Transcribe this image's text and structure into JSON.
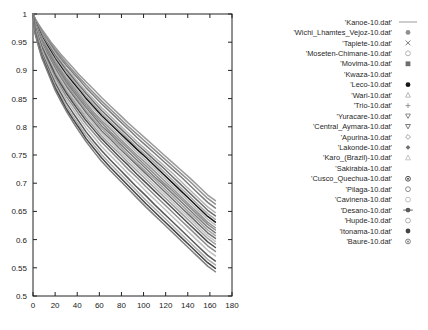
{
  "chart_data": {
    "type": "line",
    "title": "",
    "subtitle": "",
    "xlabel": "",
    "ylabel": "",
    "xlim": [
      0,
      180
    ],
    "ylim": [
      0.5,
      1
    ],
    "grid": false,
    "legend_position": "right",
    "x_ticks": [
      0,
      20,
      40,
      60,
      80,
      100,
      120,
      140,
      160,
      180
    ],
    "y_ticks": [
      0.5,
      0.55,
      0.6,
      0.65,
      0.7,
      0.75,
      0.8,
      0.85,
      0.9,
      0.95,
      1
    ],
    "x_tick_labels": [
      "0",
      "20",
      "40",
      "60",
      "80",
      "100",
      "120",
      "140",
      "160",
      "180"
    ],
    "y_tick_labels": [
      "0.5",
      "0.55",
      "0.6",
      "0.65",
      "0.7",
      "0.75",
      "0.8",
      "0.85",
      "0.9",
      "0.95",
      "1"
    ],
    "x": [
      0,
      2,
      5,
      8,
      12,
      16,
      20,
      25,
      30,
      36,
      42,
      48,
      55,
      62,
      70,
      78,
      86,
      94,
      102,
      110,
      118,
      126,
      134,
      142,
      150,
      158,
      165
    ],
    "series": [
      {
        "name": "'Kanoe-10.dat'",
        "marker": "line",
        "color": "#9a9a9a",
        "values": [
          1,
          0.992,
          0.982,
          0.973,
          0.962,
          0.951,
          0.941,
          0.929,
          0.918,
          0.905,
          0.892,
          0.88,
          0.866,
          0.852,
          0.837,
          0.822,
          0.807,
          0.793,
          0.779,
          0.765,
          0.751,
          0.737,
          0.723,
          0.709,
          0.694,
          0.679,
          0.669
        ]
      },
      {
        "name": "'Wichi_Lhamtes_Vejoz-10.dat'",
        "marker": "dot-small",
        "color": "#8f8f8f",
        "values": [
          1,
          0.991,
          0.98,
          0.97,
          0.959,
          0.948,
          0.937,
          0.925,
          0.913,
          0.9,
          0.887,
          0.874,
          0.86,
          0.846,
          0.831,
          0.816,
          0.801,
          0.787,
          0.773,
          0.759,
          0.745,
          0.731,
          0.717,
          0.703,
          0.688,
          0.673,
          0.663
        ]
      },
      {
        "name": "'Tapiete-10.dat'",
        "marker": "cross-x",
        "color": "#7d7d7d",
        "values": [
          1,
          0.99,
          0.979,
          0.968,
          0.956,
          0.945,
          0.934,
          0.921,
          0.909,
          0.896,
          0.883,
          0.869,
          0.855,
          0.841,
          0.826,
          0.811,
          0.796,
          0.781,
          0.767,
          0.753,
          0.739,
          0.725,
          0.711,
          0.696,
          0.681,
          0.666,
          0.656
        ]
      },
      {
        "name": "'Moseten-Chimane-10.dat'",
        "marker": "circle-open",
        "color": "#b4b4b4",
        "values": [
          1,
          0.989,
          0.977,
          0.966,
          0.954,
          0.942,
          0.93,
          0.917,
          0.904,
          0.891,
          0.877,
          0.863,
          0.849,
          0.834,
          0.819,
          0.804,
          0.789,
          0.774,
          0.76,
          0.746,
          0.732,
          0.718,
          0.703,
          0.688,
          0.673,
          0.658,
          0.648
        ]
      },
      {
        "name": "'Movima-10.dat'",
        "marker": "square-filled",
        "color": "#6e6e6e",
        "values": [
          1,
          0.988,
          0.976,
          0.964,
          0.951,
          0.939,
          0.927,
          0.914,
          0.901,
          0.887,
          0.873,
          0.859,
          0.844,
          0.829,
          0.814,
          0.799,
          0.784,
          0.769,
          0.755,
          0.741,
          0.727,
          0.712,
          0.697,
          0.682,
          0.667,
          0.652,
          0.642
        ]
      },
      {
        "name": "'Kwaza-10.dat'",
        "marker": "none",
        "color": "#a8a8a8",
        "values": [
          1,
          0.987,
          0.974,
          0.962,
          0.949,
          0.936,
          0.924,
          0.91,
          0.897,
          0.883,
          0.869,
          0.854,
          0.839,
          0.824,
          0.809,
          0.794,
          0.779,
          0.764,
          0.75,
          0.736,
          0.721,
          0.706,
          0.691,
          0.676,
          0.661,
          0.646,
          0.636
        ]
      },
      {
        "name": "'Leco-10.dat'",
        "marker": "circle-filled",
        "color": "#161616",
        "values": [
          1,
          0.986,
          0.973,
          0.96,
          0.947,
          0.934,
          0.921,
          0.907,
          0.893,
          0.879,
          0.865,
          0.85,
          0.835,
          0.82,
          0.805,
          0.79,
          0.775,
          0.76,
          0.746,
          0.731,
          0.716,
          0.701,
          0.686,
          0.671,
          0.656,
          0.641,
          0.631
        ]
      },
      {
        "name": "'Wari-10.dat'",
        "marker": "triangle-open",
        "color": "#b9b9b9",
        "values": [
          1,
          0.985,
          0.971,
          0.958,
          0.944,
          0.931,
          0.918,
          0.904,
          0.89,
          0.875,
          0.861,
          0.846,
          0.831,
          0.816,
          0.8,
          0.785,
          0.77,
          0.755,
          0.741,
          0.726,
          0.711,
          0.696,
          0.681,
          0.666,
          0.651,
          0.636,
          0.626
        ]
      },
      {
        "name": "'Trio-10.dat'",
        "marker": "plus",
        "color": "#949494",
        "values": [
          1,
          0.984,
          0.97,
          0.956,
          0.942,
          0.929,
          0.915,
          0.901,
          0.886,
          0.872,
          0.857,
          0.842,
          0.826,
          0.811,
          0.796,
          0.78,
          0.765,
          0.75,
          0.736,
          0.721,
          0.706,
          0.691,
          0.676,
          0.661,
          0.646,
          0.631,
          0.621
        ]
      },
      {
        "name": "'Yuracare-10.dat'",
        "marker": "triangle-down",
        "color": "#8a8a8a",
        "values": [
          1,
          0.983,
          0.968,
          0.954,
          0.94,
          0.926,
          0.912,
          0.898,
          0.883,
          0.868,
          0.853,
          0.838,
          0.822,
          0.807,
          0.791,
          0.776,
          0.761,
          0.746,
          0.731,
          0.716,
          0.701,
          0.687,
          0.672,
          0.657,
          0.642,
          0.627,
          0.617
        ]
      },
      {
        "name": "'Central_Aymara-10.dat'",
        "marker": "triangle-down-small",
        "color": "#7a7a7a",
        "values": [
          1,
          0.982,
          0.967,
          0.952,
          0.938,
          0.923,
          0.909,
          0.894,
          0.879,
          0.864,
          0.849,
          0.834,
          0.818,
          0.802,
          0.787,
          0.771,
          0.756,
          0.741,
          0.726,
          0.711,
          0.697,
          0.682,
          0.667,
          0.652,
          0.637,
          0.622,
          0.612
        ]
      },
      {
        "name": "'Apurina-10.dat'",
        "marker": "diamond-open",
        "color": "#a2a2a2",
        "values": [
          1,
          0.981,
          0.965,
          0.95,
          0.935,
          0.92,
          0.906,
          0.891,
          0.876,
          0.86,
          0.845,
          0.829,
          0.813,
          0.798,
          0.782,
          0.767,
          0.751,
          0.736,
          0.721,
          0.707,
          0.692,
          0.677,
          0.662,
          0.647,
          0.632,
          0.617,
          0.607
        ]
      },
      {
        "name": "'Lakonde-10.dat'",
        "marker": "diamond-filled",
        "color": "#707070",
        "values": [
          1,
          0.98,
          0.964,
          0.948,
          0.933,
          0.918,
          0.903,
          0.887,
          0.872,
          0.856,
          0.841,
          0.825,
          0.809,
          0.793,
          0.778,
          0.762,
          0.747,
          0.732,
          0.717,
          0.702,
          0.687,
          0.672,
          0.657,
          0.642,
          0.627,
          0.612,
          0.602
        ]
      },
      {
        "name": "'Karo_(Brazil)-10.dat'",
        "marker": "triangle-tiny",
        "color": "#c4c4c4",
        "values": [
          1,
          0.979,
          0.962,
          0.946,
          0.93,
          0.915,
          0.9,
          0.884,
          0.868,
          0.852,
          0.836,
          0.821,
          0.805,
          0.789,
          0.773,
          0.757,
          0.742,
          0.727,
          0.712,
          0.697,
          0.682,
          0.667,
          0.652,
          0.637,
          0.622,
          0.607,
          0.597
        ]
      },
      {
        "name": "'Sakirabia-10.dat'",
        "marker": "none",
        "color": "#9e9e9e",
        "values": [
          1,
          0.978,
          0.96,
          0.944,
          0.928,
          0.912,
          0.896,
          0.88,
          0.864,
          0.848,
          0.832,
          0.816,
          0.8,
          0.784,
          0.768,
          0.753,
          0.737,
          0.722,
          0.707,
          0.692,
          0.677,
          0.662,
          0.647,
          0.632,
          0.617,
          0.602,
          0.592
        ]
      },
      {
        "name": "'Cusco_Quechua-10.dat'",
        "marker": "circle-dot",
        "color": "#4f4f4f",
        "values": [
          1,
          0.976,
          0.958,
          0.941,
          0.925,
          0.909,
          0.892,
          0.876,
          0.86,
          0.843,
          0.827,
          0.811,
          0.795,
          0.779,
          0.763,
          0.747,
          0.732,
          0.716,
          0.701,
          0.686,
          0.671,
          0.656,
          0.641,
          0.626,
          0.611,
          0.596,
          0.586
        ]
      },
      {
        "name": "'Pilaga-10.dat'",
        "marker": "circle-dot-open",
        "color": "#8c8c8c",
        "values": [
          1,
          0.974,
          0.956,
          0.938,
          0.921,
          0.904,
          0.888,
          0.871,
          0.854,
          0.838,
          0.821,
          0.805,
          0.789,
          0.773,
          0.757,
          0.741,
          0.725,
          0.71,
          0.694,
          0.679,
          0.664,
          0.649,
          0.634,
          0.619,
          0.604,
          0.589,
          0.579
        ]
      },
      {
        "name": "'Cavinena-10.dat'",
        "marker": "circle-tiny",
        "color": "#bdbdbd",
        "values": [
          1,
          0.972,
          0.953,
          0.935,
          0.917,
          0.9,
          0.883,
          0.866,
          0.849,
          0.832,
          0.815,
          0.798,
          0.782,
          0.765,
          0.749,
          0.733,
          0.717,
          0.702,
          0.686,
          0.671,
          0.656,
          0.641,
          0.626,
          0.611,
          0.596,
          0.581,
          0.571
        ]
      },
      {
        "name": "'Desano-10.dat'",
        "marker": "circle-cross",
        "color": "#5a5a5a",
        "values": [
          1,
          0.97,
          0.95,
          0.931,
          0.913,
          0.895,
          0.878,
          0.86,
          0.843,
          0.825,
          0.808,
          0.791,
          0.774,
          0.758,
          0.741,
          0.725,
          0.709,
          0.693,
          0.678,
          0.662,
          0.647,
          0.632,
          0.617,
          0.602,
          0.587,
          0.572,
          0.562
        ]
      },
      {
        "name": "'Hupde-10.dat'",
        "marker": "circle-ring",
        "color": "#adadad",
        "values": [
          1,
          0.968,
          0.947,
          0.928,
          0.909,
          0.891,
          0.873,
          0.855,
          0.837,
          0.819,
          0.802,
          0.785,
          0.768,
          0.751,
          0.734,
          0.718,
          0.702,
          0.686,
          0.67,
          0.655,
          0.64,
          0.625,
          0.61,
          0.595,
          0.58,
          0.565,
          0.555
        ]
      },
      {
        "name": "'Itonama-10.dat'",
        "marker": "circle-solid",
        "color": "#454545",
        "values": [
          1,
          0.966,
          0.945,
          0.925,
          0.906,
          0.887,
          0.869,
          0.851,
          0.832,
          0.814,
          0.797,
          0.779,
          0.762,
          0.745,
          0.728,
          0.712,
          0.696,
          0.68,
          0.664,
          0.649,
          0.634,
          0.619,
          0.604,
          0.589,
          0.574,
          0.559,
          0.549
        ]
      },
      {
        "name": "'Baure-10.dat'",
        "marker": "circle-shaded",
        "color": "#7f7f7f",
        "values": [
          1,
          0.964,
          0.942,
          0.922,
          0.903,
          0.884,
          0.865,
          0.846,
          0.828,
          0.809,
          0.791,
          0.774,
          0.756,
          0.739,
          0.722,
          0.706,
          0.69,
          0.674,
          0.658,
          0.643,
          0.628,
          0.613,
          0.598,
          0.583,
          0.568,
          0.553,
          0.543
        ]
      }
    ],
    "legend_entries": [
      {
        "label": "'Kanoe-10.dat'",
        "marker": "line",
        "color": "#9a9a9a"
      },
      {
        "label": "'Wichi_Lhamtes_Vejoz-10.dat'",
        "marker": "dot-small",
        "color": "#8f8f8f"
      },
      {
        "label": "'Tapiete-10.dat'",
        "marker": "cross-x",
        "color": "#7d7d7d"
      },
      {
        "label": "'Moseten-Chimane-10.dat'",
        "marker": "circle-open",
        "color": "#b4b4b4"
      },
      {
        "label": "'Movima-10.dat'",
        "marker": "square-filled",
        "color": "#6e6e6e"
      },
      {
        "label": "'Kwaza-10.dat'",
        "marker": "none",
        "color": "#a8a8a8"
      },
      {
        "label": "'Leco-10.dat'",
        "marker": "circle-filled",
        "color": "#161616"
      },
      {
        "label": "'Wari-10.dat'",
        "marker": "triangle-open",
        "color": "#b9b9b9"
      },
      {
        "label": "'Trio-10.dat'",
        "marker": "plus",
        "color": "#949494"
      },
      {
        "label": "'Yuracare-10.dat'",
        "marker": "triangle-down",
        "color": "#8a8a8a"
      },
      {
        "label": "'Central_Aymara-10.dat'",
        "marker": "triangle-down-small",
        "color": "#7a7a7a"
      },
      {
        "label": "'Apurina-10.dat'",
        "marker": "diamond-open",
        "color": "#a2a2a2"
      },
      {
        "label": "'Lakonde-10.dat'",
        "marker": "diamond-filled",
        "color": "#707070"
      },
      {
        "label": "'Karo_(Brazil)-10.dat'",
        "marker": "triangle-tiny",
        "color": "#c4c4c4"
      },
      {
        "label": "'Sakirabia-10.dat'",
        "marker": "none",
        "color": "#9e9e9e"
      },
      {
        "label": "'Cusco_Quechua-10.dat'",
        "marker": "circle-dot",
        "color": "#4f4f4f"
      },
      {
        "label": "'Pilaga-10.dat'",
        "marker": "circle-dot-open",
        "color": "#8c8c8c"
      },
      {
        "label": "'Cavinena-10.dat'",
        "marker": "circle-tiny",
        "color": "#bdbdbd"
      },
      {
        "label": "'Desano-10.dat'",
        "marker": "circle-cross",
        "color": "#5a5a5a"
      },
      {
        "label": "'Hupde-10.dat'",
        "marker": "circle-ring",
        "color": "#adadad"
      },
      {
        "label": "'Itonama-10.dat'",
        "marker": "circle-solid",
        "color": "#454545"
      },
      {
        "label": "'Baure-10.dat'",
        "marker": "circle-shaded",
        "color": "#7f7f7f"
      }
    ]
  }
}
